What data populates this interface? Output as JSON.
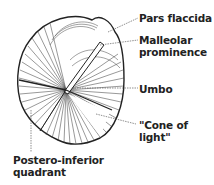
{
  "diagram": {
    "labels": [
      {
        "id": "pars-flaccida",
        "text": "Pars flaccida"
      },
      {
        "id": "malleolar-prominence",
        "line1": "Malleolar",
        "line2": "prominence"
      },
      {
        "id": "umbo",
        "text": "Umbo"
      },
      {
        "id": "cone-of-light",
        "line1": "\"Cone of",
        "line2": "light\""
      },
      {
        "id": "postero-inferior-quadrant",
        "line1": "Postero-inferior",
        "line2": "quadrant"
      }
    ]
  }
}
